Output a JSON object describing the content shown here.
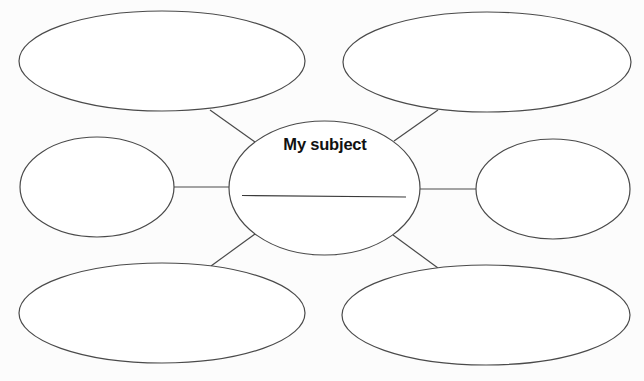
{
  "diagram": {
    "type": "mind-map / bubble web",
    "center": {
      "title": "My subject",
      "answer_line": ""
    },
    "satellites": [
      {
        "position": "top-left",
        "text": ""
      },
      {
        "position": "top-right",
        "text": ""
      },
      {
        "position": "left",
        "text": ""
      },
      {
        "position": "right",
        "text": ""
      },
      {
        "position": "bottom-left",
        "text": ""
      },
      {
        "position": "bottom-right",
        "text": ""
      }
    ],
    "colors": {
      "background": "#fcfcfc",
      "stroke": "#4a4a4a",
      "text": "#111111"
    }
  }
}
